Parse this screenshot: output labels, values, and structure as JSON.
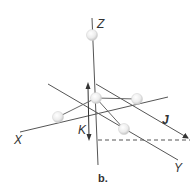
{
  "figure": {
    "caption": "b.",
    "type": "3D coordinate diagram with atoms and vectors",
    "axes": {
      "z_label": "Z",
      "x_label": "X",
      "y_label": "Y"
    },
    "vectors": {
      "j_label": "J",
      "k_label": "K"
    },
    "atoms": [
      {
        "name": "top",
        "x": 92,
        "y": 35
      },
      {
        "name": "center",
        "x": 96,
        "y": 98
      },
      {
        "name": "right",
        "x": 137,
        "y": 99
      },
      {
        "name": "left",
        "x": 58,
        "y": 117
      },
      {
        "name": "lower-right",
        "x": 124,
        "y": 129
      }
    ],
    "colors": {
      "line": "#555555",
      "sphere_light": "#ffffff",
      "sphere_dark": "#c8c8c8",
      "text": "#333333"
    }
  }
}
